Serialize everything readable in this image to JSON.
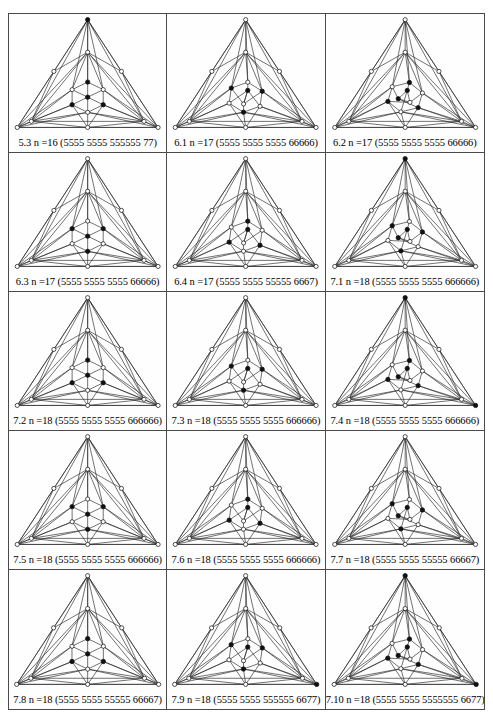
{
  "figure": {
    "columns": 3,
    "rows": 5,
    "border_color": "#4a4a4a",
    "edge_color": "#2b2b2b",
    "node_open_fill": "#ffffff",
    "node_filled_fill": "#111111",
    "background": "#ffffff"
  },
  "cells": [
    {
      "id": "5.3",
      "n_label": "n",
      "n_equals": "=",
      "n_value": "16",
      "sequence": "(5555 5555 555555 77)",
      "caption": "5.3   n =16 (5555 5555 555555 77)",
      "graph": {
        "apex_node": "filled",
        "bottom_left_node": "open",
        "bottom_right_node": "open",
        "inner_filled_count": 1,
        "vertex_count": 16
      }
    },
    {
      "id": "6.1",
      "n_label": "n",
      "n_equals": "=",
      "n_value": "17",
      "sequence": "(5555 5555 5555 66666)",
      "caption": "6.1   n =17 (5555 5555 5555 66666)",
      "graph": {
        "apex_node": "open",
        "bottom_left_node": "open",
        "bottom_right_node": "open",
        "inner_filled_count": 6,
        "vertex_count": 17
      }
    },
    {
      "id": "6.2",
      "n_label": "n",
      "n_equals": "=",
      "n_value": "17",
      "sequence": "(5555 5555 5555 66666)",
      "caption": "6.2   n =17 (5555 5555 5555 66666)",
      "graph": {
        "apex_node": "open",
        "bottom_left_node": "open",
        "bottom_right_node": "open",
        "inner_filled_count": 6,
        "vertex_count": 17
      }
    },
    {
      "id": "6.3",
      "n_label": "n",
      "n_equals": "=",
      "n_value": "17",
      "sequence": "(5555 5555 5555 66666)",
      "caption": "6.3   n =17 (5555 5555 5555 66666)",
      "graph": {
        "apex_node": "open",
        "bottom_left_node": "open",
        "bottom_right_node": "open",
        "inner_filled_count": 6,
        "vertex_count": 17
      }
    },
    {
      "id": "6.4",
      "n_label": "n",
      "n_equals": "=",
      "n_value": "17",
      "sequence": "(5555 5555 55555 6667)",
      "caption": "6.4   n =17 (5555 5555 55555 6667)",
      "graph": {
        "apex_node": "open",
        "bottom_left_node": "open",
        "bottom_right_node": "open",
        "inner_filled_count": 5,
        "vertex_count": 17
      }
    },
    {
      "id": "7.1",
      "n_label": "n",
      "n_equals": "=",
      "n_value": "18",
      "sequence": "(5555 5555 5555 666666)",
      "caption": "7.1   n =18 (5555 5555 5555 666666)",
      "graph": {
        "apex_node": "filled",
        "bottom_left_node": "open",
        "bottom_right_node": "open",
        "inner_filled_count": 6,
        "vertex_count": 18
      }
    },
    {
      "id": "7.2",
      "n_label": "n",
      "n_equals": "=",
      "n_value": "18",
      "sequence": "(5555 5555 5555 666666)",
      "caption": "7.2   n =18 (5555 5555 5555 666666)",
      "graph": {
        "apex_node": "open",
        "bottom_left_node": "open",
        "bottom_right_node": "open",
        "inner_filled_count": 6,
        "vertex_count": 18
      }
    },
    {
      "id": "7.3",
      "n_label": "n",
      "n_equals": "=",
      "n_value": "18",
      "sequence": "(5555 5555 5555 666666)",
      "caption": "7.3   n =18 (5555 5555 5555 666666)",
      "graph": {
        "apex_node": "open",
        "bottom_left_node": "open",
        "bottom_right_node": "open",
        "inner_filled_count": 7,
        "vertex_count": 18
      }
    },
    {
      "id": "7.4",
      "n_label": "n",
      "n_equals": "=",
      "n_value": "18",
      "sequence": "(5555 5555 5555 666666)",
      "caption": "7.4   n =18 (5555 5555 5555 666666)",
      "graph": {
        "apex_node": "filled",
        "bottom_left_node": "open",
        "bottom_right_node": "filled",
        "inner_filled_count": 5,
        "vertex_count": 18
      }
    },
    {
      "id": "7.5",
      "n_label": "n",
      "n_equals": "=",
      "n_value": "18",
      "sequence": "(5555 5555 5555 666666)",
      "caption": "7.5   n =18 (5555 5555 5555 666666)",
      "graph": {
        "apex_node": "open",
        "bottom_left_node": "open",
        "bottom_right_node": "open",
        "inner_filled_count": 6,
        "vertex_count": 18
      }
    },
    {
      "id": "7.6",
      "n_label": "n",
      "n_equals": "=",
      "n_value": "18",
      "sequence": "(5555 5555 5555 666666)",
      "caption": "7.6   n =18 (5555 5555 5555 666666)",
      "graph": {
        "apex_node": "open",
        "bottom_left_node": "open",
        "bottom_right_node": "open",
        "inner_filled_count": 6,
        "vertex_count": 18
      }
    },
    {
      "id": "7.7",
      "n_label": "n",
      "n_equals": "=",
      "n_value": "18",
      "sequence": "(5555 5555 55555 66667)",
      "caption": "7.7   n =18 (5555 5555 55555 66667)",
      "graph": {
        "apex_node": "open",
        "bottom_left_node": "open",
        "bottom_right_node": "open",
        "inner_filled_count": 6,
        "vertex_count": 18
      }
    },
    {
      "id": "7.8",
      "n_label": "n",
      "n_equals": "=",
      "n_value": "18",
      "sequence": "(5555 5555 55555 66667)",
      "caption": "7.8   n =18 (5555 5555 55555 66667)",
      "graph": {
        "apex_node": "open",
        "bottom_left_node": "open",
        "bottom_right_node": "open",
        "inner_filled_count": 6,
        "vertex_count": 18
      }
    },
    {
      "id": "7.9",
      "n_label": "n",
      "n_equals": "=",
      "n_value": "18",
      "sequence": "(5555 5555 555555 6677)",
      "caption": "7.9   n =18 (5555 5555 555555 6677)",
      "graph": {
        "apex_node": "open",
        "bottom_left_node": "open",
        "bottom_right_node": "filled",
        "inner_filled_count": 5,
        "vertex_count": 18
      }
    },
    {
      "id": "7.10",
      "n_label": "n",
      "n_equals": "=",
      "n_value": "18",
      "sequence": "(5555 5555 5555555   6677)",
      "caption": "7.10   n =18 (5555 5555 5555555   6677)",
      "graph": {
        "apex_node": "filled",
        "bottom_left_node": "open",
        "bottom_right_node": "filled",
        "inner_filled_count": 4,
        "vertex_count": 18
      }
    }
  ]
}
